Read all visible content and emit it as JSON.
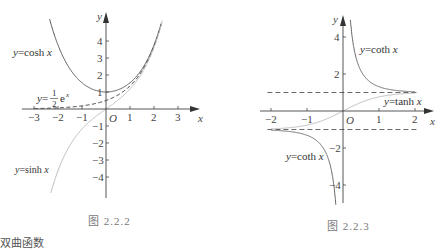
{
  "chart_data": [
    {
      "type": "line",
      "caption": "图 2.2.2",
      "xlabel": "x",
      "ylabel": "y",
      "origin_label": "O",
      "xlim": [
        -3.2,
        3.5
      ],
      "ylim": [
        -5.2,
        5
      ],
      "x_ticks": [
        -3,
        -2,
        -1,
        1,
        2,
        3
      ],
      "y_ticks": [
        -4,
        -3,
        -2,
        -1,
        1,
        2,
        3,
        4
      ],
      "grid": false,
      "series": [
        {
          "name": "y=cosh x",
          "function": "cosh",
          "style": "solid",
          "color": "#555555",
          "domain": [
            -2.35,
            2.3
          ]
        },
        {
          "name": "y=1/2 e^x",
          "function": "half_exp",
          "style": "dashed",
          "color": "#333333",
          "domain": [
            -3,
            2.3
          ]
        },
        {
          "name": "y=sinh x",
          "function": "sinh",
          "style": "solid",
          "color": "#bbbbbb",
          "domain": [
            -2.3,
            2.35
          ]
        }
      ],
      "labels": {
        "cosh": {
          "prefix": "y",
          "text": "=cosh ",
          "var": "x"
        },
        "exp": {
          "prefix": "y",
          "eq": "=",
          "num": "1",
          "den": "2",
          "text": "e",
          "sup": "x"
        },
        "sinh": {
          "prefix": "y",
          "text": "=sinh ",
          "var": "x"
        }
      }
    },
    {
      "type": "line",
      "caption": "图 2.2.3",
      "xlabel": "x",
      "ylabel": "y",
      "origin_label": "O",
      "xlim": [
        -2.2,
        2.2
      ],
      "ylim": [
        -5,
        4.8
      ],
      "x_ticks": [
        -2,
        -1,
        1,
        2
      ],
      "y_ticks": [
        -4,
        -2,
        2,
        4
      ],
      "asymptotes": [
        1,
        -1
      ],
      "grid": false,
      "series": [
        {
          "name": "y=coth x (x>0)",
          "function": "coth",
          "style": "solid",
          "color": "#666666",
          "domain": [
            0.2,
            2
          ]
        },
        {
          "name": "y=coth x (x<0)",
          "function": "coth",
          "style": "solid",
          "color": "#666666",
          "domain": [
            -2,
            -0.2
          ]
        },
        {
          "name": "y=tanh x",
          "function": "tanh",
          "style": "solid",
          "color": "#bbbbbb",
          "domain": [
            -2,
            2
          ]
        }
      ],
      "labels": {
        "coth_pos": {
          "prefix": "y",
          "text": "=coth ",
          "var": "x"
        },
        "tanh": {
          "prefix": "y",
          "text": "=tanh ",
          "var": "x"
        },
        "coth_neg": {
          "prefix": "y",
          "text": "=coth ",
          "var": "x"
        }
      }
    }
  ],
  "figures": {
    "left_caption": "图 2.2.2",
    "right_caption": "图 2.2.3"
  },
  "footer": {
    "cut_text": "双曲函数"
  },
  "colors": {
    "axis": "#444444",
    "dark_curve": "#555555",
    "light_curve": "#bbbbbb",
    "dashed": "#333333"
  }
}
